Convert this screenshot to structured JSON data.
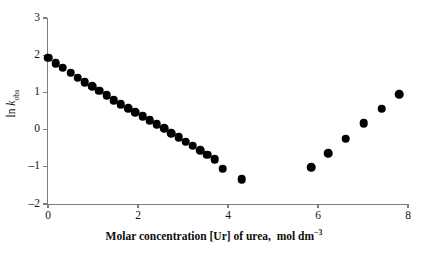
{
  "chart_data": {
    "type": "scatter",
    "title": "",
    "xlabel": "Molar concentration [Ur] of urea, mol dm−3",
    "ylabel": "ln kobs",
    "xlim": [
      0,
      8
    ],
    "ylim": [
      -2,
      3
    ],
    "grid": false,
    "legend": null,
    "xticks": [
      0,
      2,
      4,
      6,
      8
    ],
    "yticks": [
      -2,
      -1,
      0,
      1,
      2,
      3
    ],
    "xticklabels": [
      "0",
      "2",
      "4",
      "6",
      "8"
    ],
    "yticklabels": [
      "-2",
      "-1",
      "0",
      "1",
      "2",
      "3"
    ],
    "marker": "filled-circle",
    "marker_color": "#000000",
    "series": [
      {
        "name": "descending-branch",
        "x": [
          0.0,
          0.17,
          0.33,
          0.5,
          0.66,
          0.82,
          0.98,
          1.14,
          1.3,
          1.46,
          1.62,
          1.78,
          1.94,
          2.1,
          2.26,
          2.42,
          2.58,
          2.74,
          2.9,
          3.06,
          3.22,
          3.38,
          3.54,
          3.7,
          3.88,
          4.3
        ],
        "y": [
          1.93,
          1.78,
          1.66,
          1.53,
          1.4,
          1.27,
          1.16,
          1.05,
          0.92,
          0.79,
          0.68,
          0.58,
          0.47,
          0.36,
          0.25,
          0.14,
          0.03,
          -0.09,
          -0.2,
          -0.32,
          -0.43,
          -0.55,
          -0.68,
          -0.8,
          -1.05,
          -1.33
        ]
      },
      {
        "name": "ascending-branch",
        "x": [
          5.85,
          6.23,
          6.62,
          7.02,
          7.42,
          7.8
        ],
        "y": [
          -1.01,
          -0.63,
          -0.24,
          0.17,
          0.56,
          0.95
        ]
      }
    ]
  },
  "axis": {
    "x_title_main": "Molar concentration [Ur] of urea,",
    "x_title_unit_prefix": "mol dm",
    "x_title_unit_exponent": "−3",
    "y_title_prefix": "ln ",
    "y_title_symbol": "k",
    "y_title_subscript": "obs"
  },
  "colors": {
    "marker": "#000000",
    "axis": "#7d7d7d",
    "text": "#0d0d0d",
    "background": "#ffffff"
  }
}
